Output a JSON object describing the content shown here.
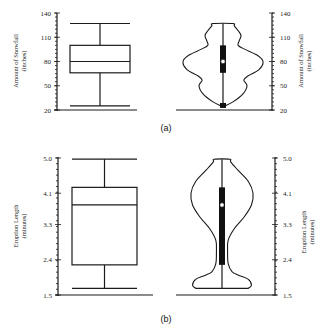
{
  "chart_data": [
    {
      "id": "a",
      "type": "box-violin",
      "caption": "(a)",
      "ylabel_line1": "Amount of Snowfall",
      "ylabel_line2": "(inches)",
      "ylim": [
        20,
        140
      ],
      "yticks": [
        20,
        50,
        80,
        110,
        140
      ],
      "tick_labels": [
        "20",
        "50",
        "80",
        "110",
        "140"
      ],
      "box": {
        "whisker_low": 25,
        "q1": 66,
        "median": 80,
        "q3": 100,
        "whisker_high": 127
      },
      "violin": {
        "min": 25,
        "max": 127,
        "median": 80,
        "q1": 66,
        "q3": 100,
        "density_profile": [
          [
            25,
            0.05
          ],
          [
            30,
            0.25
          ],
          [
            40,
            0.5
          ],
          [
            50,
            0.6
          ],
          [
            57,
            0.52
          ],
          [
            62,
            0.62
          ],
          [
            70,
            0.9
          ],
          [
            80,
            1.0
          ],
          [
            88,
            0.85
          ],
          [
            95,
            0.55
          ],
          [
            100,
            0.38
          ],
          [
            105,
            0.4
          ],
          [
            112,
            0.45
          ],
          [
            118,
            0.38
          ],
          [
            124,
            0.28
          ],
          [
            127,
            0.25
          ]
        ]
      }
    },
    {
      "id": "b",
      "type": "box-violin",
      "caption": "(b)",
      "ylabel_line1": "Eruption Length",
      "ylabel_line2": "(minutes)",
      "ylim": [
        1.5,
        5.0
      ],
      "yticks": [
        1.5,
        2.4,
        3.3,
        4.1,
        5.0
      ],
      "tick_labels": [
        "1.5",
        "2.4",
        "3.3",
        "4.1",
        "5.0"
      ],
      "box": {
        "whisker_low": 1.67,
        "q1": 2.27,
        "median": 3.8,
        "q3": 4.25,
        "whisker_high": 4.97
      },
      "violin": {
        "min": 1.67,
        "max": 4.97,
        "median": 3.8,
        "q1": 2.27,
        "q3": 4.25,
        "density_profile": [
          [
            1.67,
            0.85
          ],
          [
            1.75,
            0.95
          ],
          [
            1.9,
            0.85
          ],
          [
            2.0,
            0.55
          ],
          [
            2.1,
            0.32
          ],
          [
            2.3,
            0.2
          ],
          [
            2.6,
            0.18
          ],
          [
            2.9,
            0.2
          ],
          [
            3.2,
            0.4
          ],
          [
            3.5,
            0.72
          ],
          [
            3.8,
            0.95
          ],
          [
            4.1,
            1.0
          ],
          [
            4.4,
            0.85
          ],
          [
            4.7,
            0.5
          ],
          [
            4.9,
            0.28
          ],
          [
            4.97,
            0.25
          ]
        ]
      }
    }
  ]
}
